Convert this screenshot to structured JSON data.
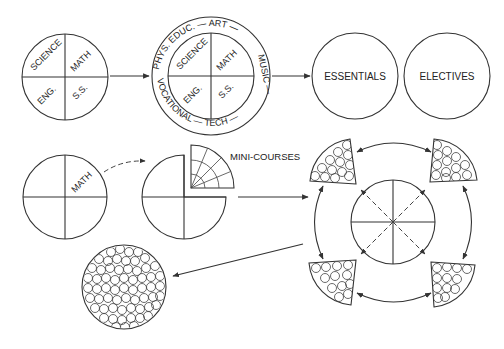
{
  "diagram": {
    "colors": {
      "line": "#333333",
      "background": "#ffffff"
    },
    "stage1": {
      "quadrants": [
        "SCIENCE",
        "MATH",
        "ENG.",
        "S.S."
      ]
    },
    "stage2": {
      "quadrants": [
        "SCIENCE",
        "MATH",
        "ENG.",
        "S.S."
      ],
      "ring_labels": {
        "top": "PHYS. EDUC. — ART —",
        "right": "MUSIC —",
        "bottom": "VOCATIONAL — TECH —",
        "left": "—"
      }
    },
    "stage3": {
      "circles": [
        "ESSENTIALS",
        "ELECTIVES"
      ]
    },
    "stage4": {
      "quadrant_label": "MATH"
    },
    "stage5": {
      "detached_label": "MINI-COURSES"
    },
    "stage6": {
      "description": "central divided circle with four mini-course wedges connected by arrows"
    },
    "stage7": {
      "description": "circle filled with many small mini-course circles"
    }
  }
}
